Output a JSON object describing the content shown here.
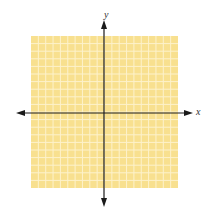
{
  "diagram": {
    "type": "coordinate-plane",
    "x_axis_label": "x",
    "y_axis_label": "y",
    "grid": {
      "columns": 20,
      "rows": 20,
      "left": 31,
      "top": 36,
      "width": 147,
      "height": 152,
      "fill_color": "#f8e08f",
      "line_color": "#fdf2cc"
    },
    "axes": {
      "color": "#1a1a1a",
      "origin_x": 104,
      "origin_y": 113,
      "x_start": 16,
      "x_end": 193,
      "y_start": 20,
      "y_end": 207
    }
  }
}
